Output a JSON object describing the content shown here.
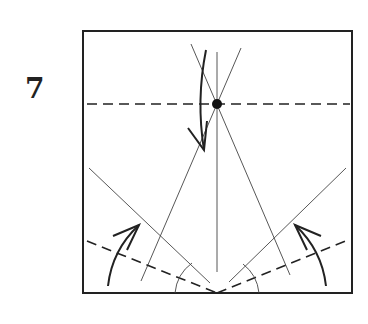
{
  "step": {
    "number": "7"
  },
  "diagram": {
    "type": "origami-fold-diagram",
    "stroke_color": "#222222",
    "elements": [
      "square-paper",
      "reference-dot",
      "horizontal-valley-fold",
      "center-crease",
      "diagonal-creases",
      "bottom-valley-folds",
      "fold-arrows",
      "angle-arcs"
    ]
  }
}
